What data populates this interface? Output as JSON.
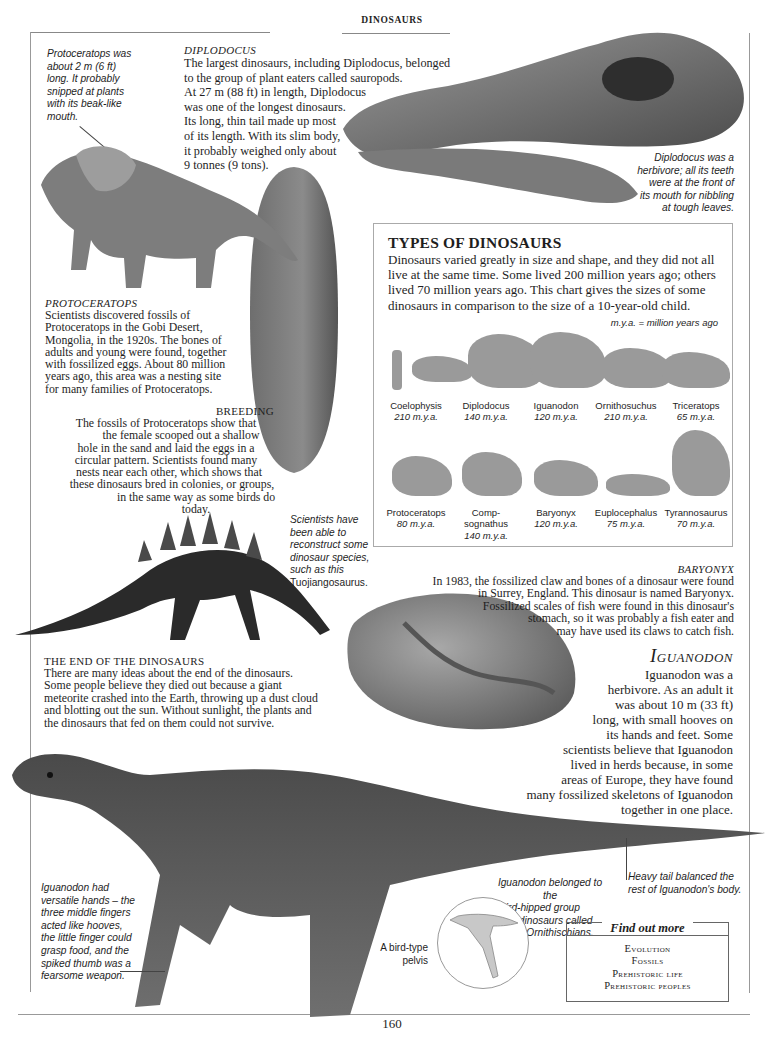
{
  "header": {
    "running_title": "DINOSAURS"
  },
  "page_number": "160",
  "protoceratops_caption": {
    "lines": [
      "Protoceratops was",
      "about 2 m (6 ft)",
      "long. It probably",
      "snipped at plants",
      "with its beak-like",
      "mouth."
    ]
  },
  "diplodocus": {
    "heading": "DIPLODOCUS",
    "lines": [
      "The largest dinosaurs, including Diplodocus, belonged",
      "to the group of plant eaters called sauropods.",
      "At 27 m (88 ft) in length, Diplodocus",
      "was one of the longest dinosaurs.",
      "Its long, thin tail made up most",
      "of its length. With its slim body,",
      "it probably weighed only about",
      "9 tonnes (9 tons)."
    ]
  },
  "diplodocus_caption": {
    "lines": [
      "Diplodocus was a",
      "herbivore; all its teeth",
      "were at the front of",
      "its mouth for nibbling",
      "at tough leaves."
    ]
  },
  "protoceratops": {
    "heading": "PROTOCERATOPS",
    "lines": [
      "Scientists discovered fossils of",
      "Protoceratops in the Gobi Desert,",
      "Mongolia, in the 1920s. The bones of",
      "adults and young were found, together",
      "with fossilized eggs. About 80 million",
      "years ago, this area was a nesting site",
      "for many families of Protoceratops."
    ]
  },
  "breeding": {
    "heading": "BREEDING",
    "lines": [
      "The fossils of Protoceratops show that",
      "the female scooped out a shallow",
      "hole in the sand and laid the eggs in a",
      "circular pattern. Scientists found many",
      "nests near each other, which shows that",
      "these dinosaurs bred in colonies, or groups,",
      "in the same way as some birds do today."
    ]
  },
  "types_of_dinosaurs": {
    "title": "TYPES OF DINOSAURS",
    "description": "Dinosaurs varied greatly in size and shape, and they did not all live at the same time. Some lived 200 million years ago; others lived 70 million years ago. This chart gives the sizes of some dinosaurs in comparison to the size of a 10-year-old child.",
    "legend": "m.y.a. = million years ago",
    "row1": [
      {
        "name": "Coelophysis",
        "mya": "210 m.y.a."
      },
      {
        "name": "Diplodocus",
        "mya": "140 m.y.a."
      },
      {
        "name": "Iguanodon",
        "mya": "120 m.y.a."
      },
      {
        "name": "Ornithosuchus",
        "mya": "210 m.y.a."
      },
      {
        "name": "Triceratops",
        "mya": "65 m.y.a."
      }
    ],
    "row2": [
      {
        "name": "Protoceratops",
        "mya": "80 m.y.a."
      },
      {
        "name": "Comp-\nsognathus",
        "mya": "140 m.y.a."
      },
      {
        "name": "Baryonyx",
        "mya": "120 m.y.a."
      },
      {
        "name": "Euplocephalus",
        "mya": "75 m.y.a."
      },
      {
        "name": "Tyrannosaurus",
        "mya": "70 m.y.a."
      }
    ]
  },
  "skeleton_caption": {
    "lines": [
      "Scientists have",
      "been able to",
      "reconstruct some",
      "dinosaur species,",
      "such as this",
      "Tuojiangosaurus."
    ]
  },
  "baryonyx": {
    "heading": "BARYONYX",
    "lines": [
      "In 1983, the fossilized claw and bones of a dinosaur were found",
      "in Surrey, England. This dinosaur is named Baryonyx.",
      "Fossilized scales of fish were found in this dinosaur's",
      "stomach, so it was probably a fish eater and",
      "may have used its claws to catch fish."
    ]
  },
  "end_of_dinosaurs": {
    "heading": "THE END OF THE DINOSAURS",
    "lines": [
      "There are many ideas about the end of the dinosaurs.",
      "Some people believe they died out because a giant",
      "meteorite crashed into the Earth, throwing up a dust cloud",
      "and blotting out the sun. Without sunlight, the plants and",
      "the dinosaurs that fed on them could not survive."
    ]
  },
  "iguanodon": {
    "heading": "Iguanodon",
    "lines": [
      "Iguanodon was a",
      "herbivore. As an adult it",
      "was about 10 m (33 ft)",
      "long, with small hooves on",
      "its hands and feet. Some",
      "scientists believe that Iguanodon",
      "lived in herds because, in some",
      "areas of Europe, they have found",
      "many fossilized skeletons of Iguanodon",
      "together in one place."
    ]
  },
  "hands_caption": {
    "lines": [
      "Iguanodon had",
      "versatile hands – the",
      "three middle fingers",
      "acted like hooves,",
      "the little finger could",
      "grasp food, and the",
      "spiked thumb was a",
      "fearsome weapon."
    ]
  },
  "tail_caption": {
    "lines": [
      "Heavy tail balanced the",
      "rest of Iguanodon's body."
    ]
  },
  "bird_hipped_caption": {
    "lines": [
      "Iguanodon belonged to the",
      "bird-hipped group",
      "of dinosaurs called",
      "Ornithischians."
    ]
  },
  "pelvis_caption": {
    "lines": [
      "A bird-type",
      "pelvis"
    ]
  },
  "find_out_more": {
    "title": "Find out more",
    "items": [
      "Evolution",
      "Fossils",
      "Prehistoric life",
      "Prehistoric peoples"
    ]
  },
  "images": {
    "protoceratops": "protoceratops-illustration",
    "egg_nest_fossil": "fossil-egg-illustration",
    "diplodocus_skull": "diplodocus-skull-photo",
    "tuojiangosaurus_skeleton": "stegosaur-skeleton-photo",
    "baryonyx_fossil": "baryonyx-fossil-photo",
    "iguanodon": "iguanodon-illustration",
    "pelvis_diagram": "bird-pelvis-diagram"
  }
}
